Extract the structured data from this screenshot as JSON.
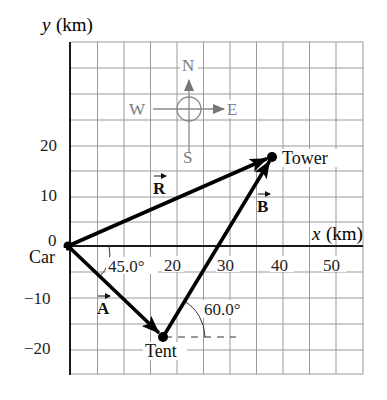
{
  "figure": {
    "y_axis_label_var": "y",
    "y_axis_label_unit": "(km)",
    "x_axis_label_var": "x",
    "x_axis_label_unit": "(km)",
    "x_ticks": [
      "20",
      "30",
      "40",
      "50"
    ],
    "y_ticks": [
      "20",
      "10",
      "0",
      "−10",
      "−20"
    ],
    "compass": {
      "north": "N",
      "south": "S",
      "east": "E",
      "west": "W"
    },
    "points": {
      "car": {
        "label": "Car",
        "x_km": 0,
        "y_km": 0
      },
      "tent": {
        "label": "Tent",
        "x_km": 17.7,
        "y_km": -17.7
      },
      "tower": {
        "label": "Tower",
        "x_km": 38.6,
        "y_km": 17.0
      }
    },
    "vectors": {
      "A": {
        "label": "A",
        "from": "Car",
        "to": "Tent"
      },
      "B": {
        "label": "B",
        "from": "Tent",
        "to": "Tower"
      },
      "R": {
        "label": "R",
        "from": "Car",
        "to": "Tower"
      }
    },
    "angles": {
      "angle_A": "45.0°",
      "angle_B": "60.0°"
    },
    "colors": {
      "vector": "#000000",
      "grid": "#9a9a9a",
      "compass": "#8a8a8a"
    }
  }
}
